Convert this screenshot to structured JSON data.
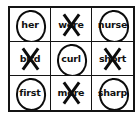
{
  "worksheet": {
    "title": "r-controlled vowel word sort grid",
    "rows": 3,
    "columns": 3,
    "mark_types": {
      "circle": "circled",
      "cross": "crossed-out"
    },
    "colors": {
      "ink": "#101010",
      "border": "#141414",
      "background": "#ffffff"
    },
    "cells": [
      {
        "word": "her",
        "mark": "circle"
      },
      {
        "word": "were",
        "mark": "cross"
      },
      {
        "word": "nurse",
        "mark": "circle"
      },
      {
        "word": "bird",
        "mark": "cross"
      },
      {
        "word": "curl",
        "mark": "circle"
      },
      {
        "word": "short",
        "mark": "cross"
      },
      {
        "word": "first",
        "mark": "circle"
      },
      {
        "word": "more",
        "mark": "cross"
      },
      {
        "word": "sharp",
        "mark": "circle"
      }
    ]
  }
}
